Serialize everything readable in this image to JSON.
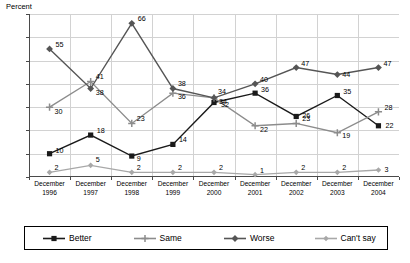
{
  "chart_data": {
    "type": "line",
    "title": "",
    "xlabel": "",
    "ylabel": "Percent",
    "ylim": [
      0,
      70
    ],
    "ytick_step": 10,
    "yticks": [
      "0",
      "10",
      "20",
      "30",
      "40",
      "50",
      "60",
      "70"
    ],
    "grid": true,
    "legend_position": "bottom",
    "categories": [
      "December\n1996",
      "December\n1997",
      "December\n1998",
      "December\n1999",
      "December\n2000",
      "December\n2001",
      "December\n2002",
      "December\n2003",
      "December\n2004"
    ],
    "category_lines": [
      [
        "December",
        "1996"
      ],
      [
        "December",
        "1997"
      ],
      [
        "December",
        "1998"
      ],
      [
        "December",
        "1999"
      ],
      [
        "December",
        "2000"
      ],
      [
        "December",
        "2001"
      ],
      [
        "December",
        "2002"
      ],
      [
        "December",
        "2003"
      ],
      [
        "December",
        "2004"
      ]
    ],
    "series": [
      {
        "name": "Better",
        "color": "#1a1a1a",
        "marker": "square",
        "values": [
          10,
          18,
          9,
          14,
          32,
          36,
          26,
          35,
          22
        ],
        "label_offsets": [
          [
            6,
            -3
          ],
          [
            6,
            -4
          ],
          [
            5,
            3
          ],
          [
            6,
            -4
          ],
          [
            7,
            3
          ],
          [
            6,
            -3
          ],
          [
            6,
            0
          ],
          [
            6,
            -4
          ],
          [
            7,
            0
          ]
        ]
      },
      {
        "name": "Same",
        "color": "#8c8c8c",
        "marker": "cross",
        "values": [
          30,
          41,
          23,
          36,
          34,
          22,
          23,
          19,
          28
        ],
        "label_offsets": [
          [
            5,
            5
          ],
          [
            5,
            -5
          ],
          [
            5,
            -4
          ],
          [
            5,
            4
          ],
          [
            4,
            -6
          ],
          [
            5,
            4
          ],
          [
            6,
            -4
          ],
          [
            5,
            3
          ],
          [
            6,
            -4
          ]
        ]
      },
      {
        "name": "Worse",
        "color": "#555555",
        "marker": "diamond",
        "values": [
          55,
          38,
          66,
          38,
          34,
          40,
          47,
          44,
          47
        ],
        "label_offsets": [
          [
            6,
            -4
          ],
          [
            5,
            4
          ],
          [
            6,
            -4
          ],
          [
            5,
            -5
          ],
          [
            5,
            4
          ],
          [
            5,
            -4
          ],
          [
            5,
            -4
          ],
          [
            5,
            0
          ],
          [
            5,
            -4
          ]
        ]
      },
      {
        "name": "Can't say",
        "color": "#a8a8a8",
        "marker": "diamond-small",
        "values": [
          2,
          5,
          2,
          2,
          2,
          1,
          2,
          2,
          3
        ],
        "label_offsets": [
          [
            5,
            -4
          ],
          [
            5,
            -5
          ],
          [
            5,
            -4
          ],
          [
            5,
            -4
          ],
          [
            5,
            -4
          ],
          [
            5,
            -4
          ],
          [
            5,
            -4
          ],
          [
            5,
            -4
          ],
          [
            6,
            0
          ]
        ]
      }
    ]
  },
  "legend": {
    "items": [
      {
        "label": "Better"
      },
      {
        "label": "Same"
      },
      {
        "label": "Worse"
      },
      {
        "label": "Can't say"
      }
    ]
  }
}
